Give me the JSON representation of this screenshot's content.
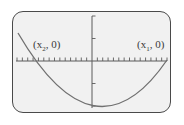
{
  "chart_data": {
    "type": "line",
    "title": "",
    "xlabel": "",
    "ylabel": "",
    "grid": false,
    "legend": null,
    "axes": {
      "x_ticks_each_side": 14,
      "y_ticks_each_side": 2,
      "x_range_units": [
        -14,
        14
      ],
      "y_range_units": [
        -2,
        2
      ]
    },
    "series": [
      {
        "name": "parabola",
        "x": [
          -14,
          -10.2,
          -6,
          -2,
          0,
          1.5,
          4,
          8,
          12,
          14
        ],
        "y": [
          1.2,
          0,
          -0.95,
          -1.55,
          -1.45,
          -1.47,
          -1.45,
          -1.1,
          -0.35,
          0
        ]
      }
    ],
    "annotations": [
      {
        "text": "(x2, 0)",
        "base": "x",
        "sub": "2",
        "rest": ", 0)",
        "point": [
          -10.2,
          0
        ]
      },
      {
        "text": "(x1, 0)",
        "base": "x",
        "sub": "1",
        "rest": ", 0)",
        "point": [
          14,
          0
        ]
      }
    ]
  },
  "labels": {
    "left_root": {
      "open": "(x",
      "sub": "2",
      "close": ", 0)"
    },
    "right_root": {
      "open": "(x",
      "sub": "1",
      "close": ", 0)"
    }
  },
  "colors": {
    "background": "#f1f1f1",
    "frame": "#4a4a4a",
    "axis": "#5a5a5a",
    "curve": "#707070",
    "text": "#3a3a3a"
  }
}
